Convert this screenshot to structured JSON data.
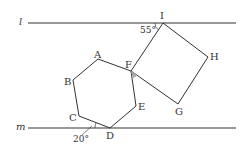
{
  "diagram": {
    "lines": [
      {
        "name": "l",
        "label": "l"
      },
      {
        "name": "m",
        "label": "m"
      }
    ],
    "points": {
      "A": "A",
      "B": "B",
      "C": "C",
      "D": "D",
      "E": "E",
      "F": "F",
      "G": "G",
      "H": "H",
      "I": "I"
    },
    "angles": {
      "angle_at_I": "55°",
      "angle_at_D": "20°"
    },
    "shapes": [
      {
        "type": "regular-hexagon",
        "vertices": [
          "A",
          "B",
          "C",
          "D",
          "E",
          "F"
        ]
      },
      {
        "type": "square",
        "vertices": [
          "F",
          "I",
          "H",
          "G"
        ]
      }
    ],
    "colors": {
      "stroke": "#333333",
      "angle_mark_fill": "#aaaaaa"
    }
  }
}
